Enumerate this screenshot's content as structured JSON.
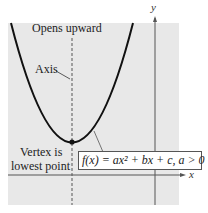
{
  "figure": {
    "title_label": "Opens upward",
    "axis_label": "Axis",
    "vertex_label_line1": "Vertex is",
    "vertex_label_line2": "lowest point",
    "equation": "f(x) = ax² + bx + c, a > 0",
    "x_axis_label": "x",
    "y_axis_label": "y"
  },
  "colors": {
    "panel": "#e8e8e8",
    "curve": "#111111",
    "axis": "#555555"
  }
}
